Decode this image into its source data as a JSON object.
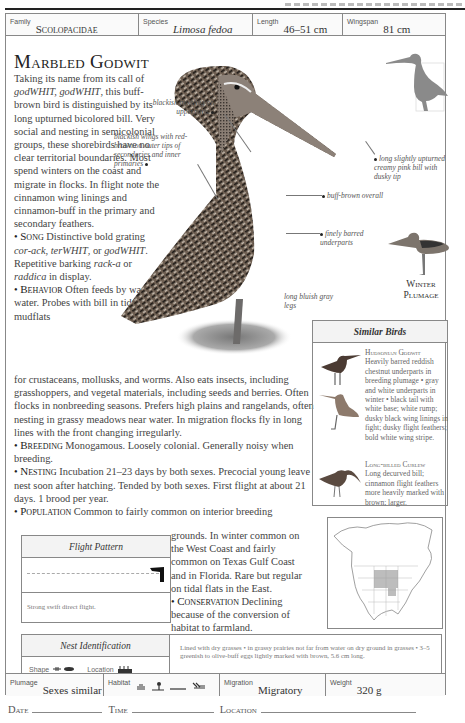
{
  "header": {
    "family_label": "Family",
    "family_value": "Scolopacidae",
    "species_label": "Species",
    "species_value": "Limosa fedoa",
    "length_label": "Length",
    "length_value": "46–51 cm",
    "wingspan_label": "Wingspan",
    "wingspan_value": "81 cm"
  },
  "title": "Marbled Godwit",
  "intro": {
    "pre": "Taking its name from its call of ",
    "call": "godWHIT, godWHIT",
    "post": ", this buff-brown bird is distinguished by its long upturned bicolored bill. Very social and nesting in semicolonial groups, these shorebirds have no clear territorial boundaries. Most spend winters on the coast and migrate in flocks. In flight note the cinnamon wing linings and cinnamon-buff in the primary and secondary feathers."
  },
  "song": {
    "heading": "Song",
    "t1": " Distinctive bold grating ",
    "i1": "cor-ack",
    "t2": ", ",
    "i2": "terWHIT",
    "t3": ", or ",
    "i3": "godWHIT",
    "t4": ". Repetitive barking ",
    "i4": "rack-a",
    "t5": " or ",
    "i5": "raddica",
    "t6": " in display."
  },
  "behavior": {
    "heading": "Behavior",
    "text_narrow": " Often feeds by wading into water. Probes with bill in tidal flats and mudflats",
    "text_wide": "for crustaceans, mollusks, and worms. Also eats insects, including grasshoppers, and vegetal materials, including seeds and berries. Often flocks in nonbreeding seasons. Prefers high plains and rangelands, often nesting in grassy meadows near water. In migration flocks fly in long lines with the front changing irregularly."
  },
  "breeding": {
    "heading": "Breeding",
    "text": " Monogamous. Loosely colonial. Generally noisy when breeding."
  },
  "nesting": {
    "heading": "Nesting",
    "text": " Incubation 21–23 days by both sexes. Precocial young leave nest soon after hatching. Tended by both sexes. First flight at about 21 days. 1 brood per year."
  },
  "population": {
    "heading": "Population",
    "text_first": " Common to fairly common on interior breeding",
    "text_rest": "grounds. In winter common on the West Coast and fairly common on Texas Gulf Coast and in Florida. Rare but regular on tidal flats in the East."
  },
  "conservation": {
    "heading": "Conservation",
    "text": " Declining because of the conversion of habitat to farmland."
  },
  "annotations": {
    "mottling": "blackish mottling on upperparts",
    "wings": "blackish wings with red-brown on outer tips of secondaries and inner primaries",
    "bill": "long slightly upturned creamy pink bill with dusky tip",
    "overall": "buff-brown overall",
    "underparts": "finely barred underparts",
    "legs": "long bluish gray legs"
  },
  "winter_plumage": {
    "line1": "Winter",
    "line2": "Plumage"
  },
  "similar_birds": {
    "heading": "Similar Birds",
    "items": [
      {
        "name": "Hudsonian Godwit",
        "description": "Heavily barred reddish chestnut underparts in breeding plumage • gray and white underparts in winter • black tail with white base; white rump; dusky black wing linings in fight; dusky flight feathers; bold white wing stripe."
      },
      {
        "name": "Long-billed Curlew",
        "description": "Long decurved bill; cinnamon flight feathers more heavily marked with brown; larger."
      }
    ]
  },
  "flight_pattern": {
    "heading": "Flight Pattern",
    "description": "Strong swift direct flight."
  },
  "nest_id": {
    "heading": "Nest Identification",
    "shape_label": "Shape",
    "location_label": "Location",
    "description": "Lined with dry grasses • in grassy prairies not far from water on dry ground in grasses • 3–5 greenish to olive-buff eggs lightly marked with brown, 5.6 cm long."
  },
  "footer": {
    "plumage_label": "Plumage",
    "plumage_value": "Sexes similar",
    "habitat_label": "Habitat",
    "habitat_icons": [
      "lake-icon",
      "shore-icon",
      "grassland-icon",
      "marsh-icon"
    ],
    "migration_label": "Migration",
    "migration_value": "Migratory",
    "weight_label": "Weight",
    "weight_value": "320 g"
  },
  "log": {
    "date_label": "Date",
    "time_label": "Time",
    "location_label": "Location"
  },
  "colors": {
    "border": "#888888",
    "silhouette": "#8a8a8a",
    "range_fill": "#999999"
  }
}
